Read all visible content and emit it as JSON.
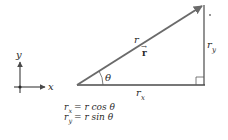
{
  "figure": {
    "axes": {
      "x_label": "x",
      "y_label": "y"
    },
    "triangle": {
      "hypotenuse_label": "r",
      "vector_label": "r",
      "vector_arrow": "→",
      "angle_label": "θ",
      "adjacent_label_base": "r",
      "adjacent_label_sub": "x",
      "opposite_label_base": "r",
      "opposite_label_sub": "y",
      "corner_mark": "°"
    },
    "equations": [
      {
        "lhs_base": "r",
        "lhs_sub": "x",
        "rhs": "= r cos θ"
      },
      {
        "lhs_base": "r",
        "lhs_sub": "y",
        "rhs": "= r sin θ"
      }
    ],
    "colors": {
      "line": "#4a4a4a",
      "vector": "#6a6a6a",
      "text": "#2a2a2a"
    }
  }
}
